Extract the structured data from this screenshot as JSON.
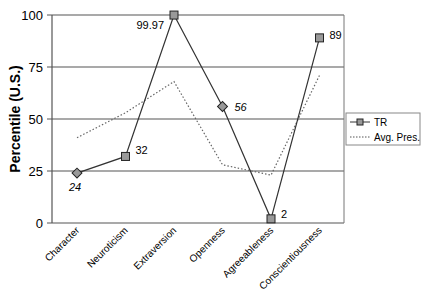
{
  "chart_data": {
    "type": "line",
    "title": "",
    "xlabel": "",
    "ylabel": "Percentile (U.S.)",
    "ylim": [
      0,
      100
    ],
    "yticks": [
      0,
      25,
      50,
      75,
      100
    ],
    "grid": true,
    "legend_position": "right",
    "categories": [
      "Character",
      "Neuroticism",
      "Extraversion",
      "Openness",
      "Agreeableness",
      "Conscientiousness"
    ],
    "series": [
      {
        "name": "TR",
        "style": "solid line with square markers",
        "values": [
          24,
          32,
          99.97,
          56,
          2,
          89
        ],
        "data_labels": [
          "24",
          "32",
          "99.97",
          "56",
          "2",
          "89"
        ]
      },
      {
        "name": "Avg. Pres.",
        "style": "dotted line",
        "values": [
          41,
          53,
          68,
          28,
          23,
          71
        ]
      }
    ]
  },
  "legend": {
    "items": [
      {
        "label": "TR"
      },
      {
        "label": "Avg. Pres."
      }
    ]
  },
  "colors": {
    "line": "#333333",
    "marker_fill": "#999999",
    "grid": "#555555"
  }
}
